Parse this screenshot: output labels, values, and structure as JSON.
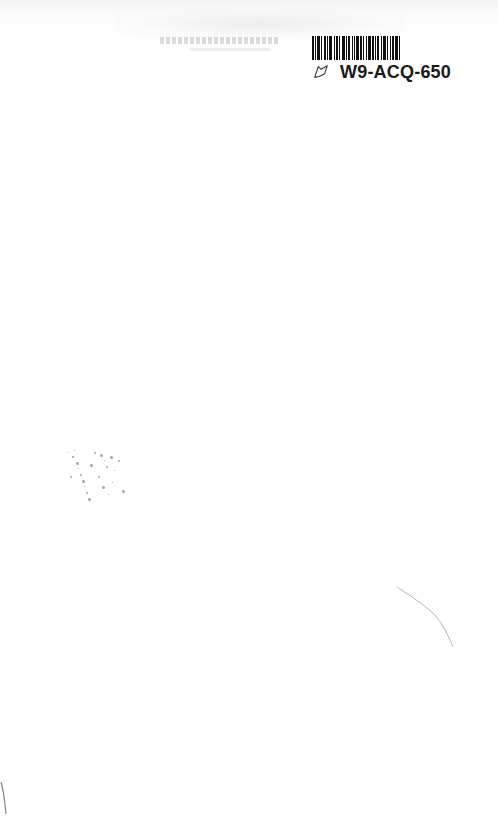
{
  "page": {
    "type": "scanned-blank-page",
    "background_color": "#ffffff"
  },
  "barcode_label": {
    "code": "W9-ACQ-650",
    "icon": "library-leaf-icon",
    "bar_color": "#111111"
  }
}
